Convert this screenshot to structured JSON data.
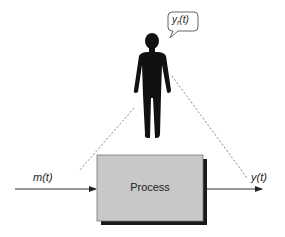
{
  "diagram": {
    "process": {
      "label": "Process",
      "fill": "#c8c8c8",
      "shadow": "#1a1a1a",
      "border": "#777777"
    },
    "input": {
      "label": "m(t)"
    },
    "output": {
      "label": "y(t)"
    },
    "observer": {
      "icon": "person-silhouette-icon",
      "thought": {
        "base": "y",
        "subscript": "r",
        "suffix": "(t)"
      }
    },
    "colors": {
      "line": "#333333",
      "dashed": "#777777",
      "figure": "#111111"
    }
  }
}
